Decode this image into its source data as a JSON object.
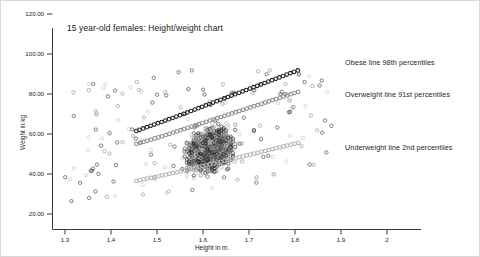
{
  "chart_data": {
    "type": "scatter",
    "title": "15 year-old females: Height/weight chart",
    "xlabel": "Height in m.",
    "ylabel": "Weight in kg",
    "xlim": [
      1.25,
      2.03
    ],
    "ylim": [
      15.0,
      127.0
    ],
    "grid": false,
    "legend_position": "none",
    "xticks": [
      "1.3",
      "1.4",
      "1.5",
      "1.6",
      "1.7",
      "1.8",
      "1.9",
      "2"
    ],
    "xtick_values": [
      1.3,
      1.4,
      1.5,
      1.6,
      1.7,
      1.8,
      1.9,
      2.0
    ],
    "yticks": [
      "120.00",
      "100.00",
      "80.00",
      "60.00",
      "40.00",
      "20.00"
    ],
    "ytick_values": [
      120,
      100,
      80,
      60,
      40,
      20
    ],
    "marker": "open-circle",
    "annotations": [
      {
        "name": "obese",
        "text": "Obese line 98th percentiles",
        "x": 1.83,
        "y": 96.0
      },
      {
        "name": "overweight",
        "text": "Overweight line 91st percentiles",
        "x": 1.83,
        "y": 80.0
      },
      {
        "name": "underweight",
        "text": "Underweight line 2nd percentiles",
        "x": 1.83,
        "y": 54.0
      }
    ],
    "series": [
      {
        "name": "Obese line 98th percentiles",
        "color": "#1d1d1d",
        "x": [
          1.455,
          1.462,
          1.47,
          1.478,
          1.486,
          1.494,
          1.502,
          1.51,
          1.518,
          1.526,
          1.534,
          1.542,
          1.55,
          1.558,
          1.566,
          1.574,
          1.582,
          1.59,
          1.598,
          1.606,
          1.614,
          1.622,
          1.63,
          1.638,
          1.646,
          1.654,
          1.662,
          1.67,
          1.678,
          1.686,
          1.694,
          1.702,
          1.71,
          1.718,
          1.726,
          1.734,
          1.742,
          1.75,
          1.758,
          1.766,
          1.774,
          1.782,
          1.79,
          1.798,
          1.806
        ],
        "y": [
          61.5,
          62.1,
          62.8,
          63.4,
          64.1,
          64.7,
          65.4,
          66.0,
          66.7,
          67.4,
          68.0,
          68.7,
          69.4,
          70.1,
          70.8,
          71.5,
          72.2,
          72.9,
          73.6,
          74.3,
          75.0,
          75.7,
          76.4,
          77.1,
          77.8,
          78.5,
          79.2,
          79.9,
          80.6,
          81.3,
          82.0,
          82.7,
          83.4,
          84.1,
          84.8,
          85.5,
          86.2,
          86.9,
          87.6,
          88.3,
          89.0,
          89.7,
          90.4,
          91.1,
          91.8
        ]
      },
      {
        "name": "Overweight line 91st percentiles",
        "color": "#8c8c8c",
        "x": [
          1.455,
          1.463,
          1.471,
          1.479,
          1.487,
          1.495,
          1.503,
          1.511,
          1.519,
          1.527,
          1.535,
          1.543,
          1.551,
          1.559,
          1.567,
          1.575,
          1.583,
          1.591,
          1.599,
          1.607,
          1.615,
          1.623,
          1.631,
          1.639,
          1.647,
          1.655,
          1.663,
          1.671,
          1.679,
          1.687,
          1.695,
          1.703,
          1.711,
          1.719,
          1.727,
          1.735,
          1.743,
          1.751,
          1.759,
          1.767,
          1.775,
          1.783,
          1.791,
          1.799,
          1.807
        ],
        "y": [
          55.0,
          55.5,
          56.1,
          56.6,
          57.2,
          57.8,
          58.3,
          58.9,
          59.5,
          60.1,
          60.7,
          61.3,
          61.9,
          62.5,
          63.1,
          63.7,
          64.3,
          64.9,
          65.5,
          66.1,
          66.7,
          67.3,
          67.9,
          68.5,
          69.1,
          69.7,
          70.3,
          70.9,
          71.5,
          72.1,
          72.7,
          73.3,
          73.9,
          74.5,
          75.1,
          75.7,
          76.3,
          76.9,
          77.5,
          78.1,
          78.7,
          79.3,
          79.9,
          80.5,
          81.1
        ]
      },
      {
        "name": "Underweight line 2nd percentiles",
        "color": "#b4b4b4",
        "x": [
          1.455,
          1.463,
          1.471,
          1.479,
          1.487,
          1.495,
          1.503,
          1.511,
          1.519,
          1.527,
          1.535,
          1.543,
          1.551,
          1.559,
          1.567,
          1.575,
          1.583,
          1.591,
          1.599,
          1.607,
          1.615,
          1.623,
          1.631,
          1.639,
          1.647,
          1.655,
          1.663,
          1.671,
          1.679,
          1.687,
          1.695,
          1.703,
          1.711,
          1.719,
          1.727,
          1.735,
          1.743,
          1.751,
          1.759,
          1.767,
          1.775,
          1.783,
          1.791,
          1.799,
          1.807
        ],
        "y": [
          36.5,
          36.9,
          37.3,
          37.7,
          38.1,
          38.5,
          38.9,
          39.3,
          39.7,
          40.1,
          40.5,
          40.9,
          41.4,
          41.8,
          42.2,
          42.6,
          43.1,
          43.5,
          43.9,
          44.4,
          44.8,
          45.2,
          45.7,
          46.1,
          46.6,
          47.0,
          47.5,
          47.9,
          48.4,
          48.8,
          49.3,
          49.7,
          50.2,
          50.6,
          51.1,
          51.5,
          52.0,
          52.4,
          52.9,
          53.3,
          53.8,
          54.2,
          54.7,
          55.1,
          55.6
        ]
      }
    ],
    "scatter_note": "Dense population cloud of individual 15-year-old female height/weight observations, concentrated between 1.50 m and 1.75 m and 38 kg to 78 kg, with sparse outliers from 1.30 m to 1.88 m and 22 kg to 88 kg."
  }
}
